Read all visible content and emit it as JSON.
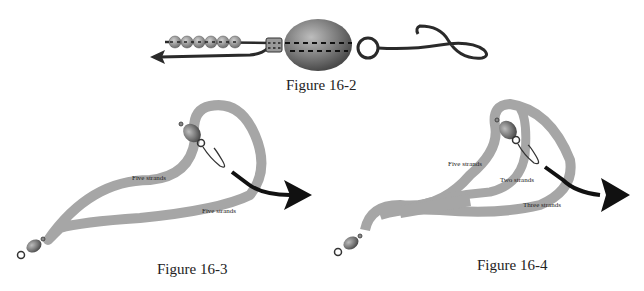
{
  "figures": [
    {
      "id": "16-2",
      "caption": "Figure 16-2"
    },
    {
      "id": "16-3",
      "caption": "Figure 16-3",
      "labels": [
        "Five strands",
        "Five strands"
      ]
    },
    {
      "id": "16-4",
      "caption": "Figure 16-4",
      "labels": [
        "Five strands",
        "Two strands",
        "Three strands"
      ]
    }
  ],
  "colors": {
    "strand": "#a6a6a6",
    "wire": "#2a2a2a",
    "bead": "#8a8a8a",
    "background": "#ffffff"
  }
}
